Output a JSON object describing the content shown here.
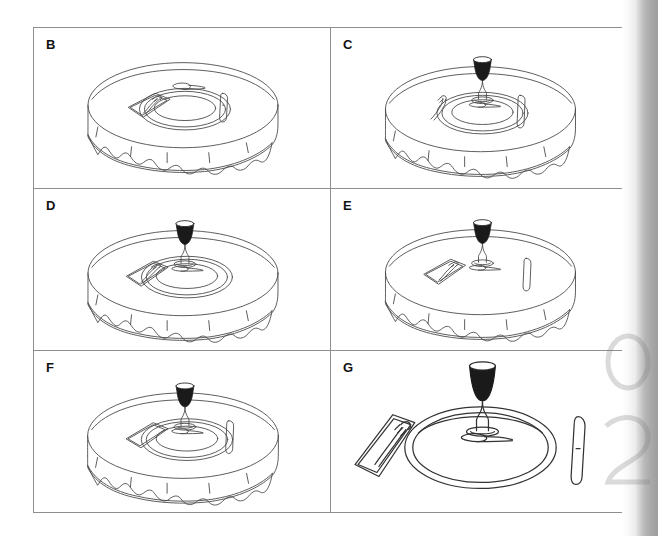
{
  "figure": {
    "panel_count": 6,
    "stroke_color": "#4a4a4a",
    "fill_dark": "#1a1a1a",
    "border_color": "#8e8e8e",
    "background": "#ffffff",
    "scan_edge_color": "#a9a9a9"
  },
  "panels": [
    {
      "id": "B",
      "label": "B",
      "scene": "table-setting-on-round-table",
      "items": [
        "round-table",
        "tablecloth",
        "napkin",
        "fork",
        "plate",
        "knife",
        "spoon"
      ],
      "missing": [
        "wine-glass"
      ]
    },
    {
      "id": "C",
      "label": "C",
      "scene": "table-setting-on-round-table",
      "items": [
        "round-table",
        "tablecloth",
        "fork",
        "plate",
        "knife",
        "spoon",
        "wine-glass"
      ],
      "missing": [
        "napkin"
      ]
    },
    {
      "id": "D",
      "label": "D",
      "scene": "table-setting-on-round-table",
      "items": [
        "round-table",
        "tablecloth",
        "napkin",
        "fork",
        "plate",
        "spoon",
        "wine-glass"
      ],
      "missing": [
        "knife"
      ]
    },
    {
      "id": "E",
      "label": "E",
      "scene": "table-setting-on-round-table",
      "items": [
        "round-table",
        "tablecloth",
        "napkin",
        "fork",
        "knife",
        "spoon",
        "wine-glass"
      ],
      "missing": [
        "plate"
      ]
    },
    {
      "id": "F",
      "label": "F",
      "scene": "table-setting-on-round-table",
      "items": [
        "round-table",
        "tablecloth",
        "napkin",
        "plate",
        "knife",
        "spoon",
        "wine-glass"
      ],
      "missing": [
        "fork"
      ]
    },
    {
      "id": "G",
      "label": "G",
      "scene": "table-setting-closeup-no-table",
      "items": [
        "napkin",
        "fork",
        "plate",
        "knife",
        "spoon",
        "wine-glass"
      ],
      "missing": []
    }
  ]
}
